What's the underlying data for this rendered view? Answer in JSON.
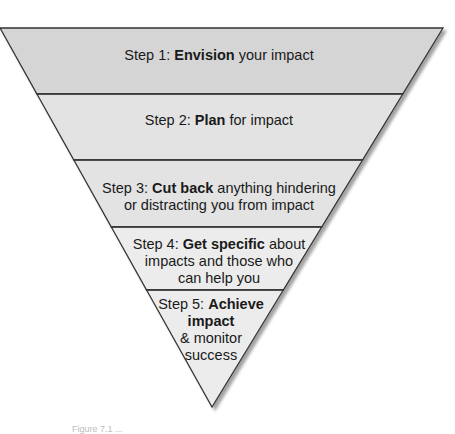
{
  "diagram": {
    "type": "inverted-funnel",
    "colors": {
      "band_top": "#d5d5d5",
      "band_mid": "#e3e3e3",
      "band_low": "#ececec",
      "outline": "#333333",
      "shadow": "#9a9a9a"
    },
    "steps": [
      {
        "prefix": "Step 1: ",
        "bold": "Envision",
        "suffix": " your impact",
        "lines": [
          [
            "Step 1: ",
            "Envision",
            " your impact"
          ]
        ]
      },
      {
        "prefix": "Step 2: ",
        "bold": "Plan",
        "suffix": " for impact",
        "lines": [
          [
            "Step 2: ",
            "Plan",
            " for impact"
          ]
        ]
      },
      {
        "prefix": "Step 3: ",
        "bold": "Cut back",
        "suffix": " anything hindering or distracting you from impact",
        "lines": [
          [
            "Step 3: ",
            "Cut back",
            " anything hindering"
          ],
          [
            "",
            "",
            "or distracting you from impact"
          ]
        ]
      },
      {
        "prefix": "Step 4: ",
        "bold": "Get specific",
        "suffix": " about impacts and those who can help you",
        "lines": [
          [
            "Step 4: ",
            "Get specific",
            " about"
          ],
          [
            "",
            "",
            "impacts and those who"
          ],
          [
            "",
            "",
            "can help you"
          ]
        ]
      },
      {
        "prefix": "Step 5: ",
        "bold": "Achieve impact",
        "suffix": " & monitor success",
        "lines": [
          [
            "Step 5: ",
            "Achieve",
            ""
          ],
          [
            "",
            "impact",
            ""
          ],
          [
            "",
            "",
            "& monitor"
          ],
          [
            "",
            "",
            "success"
          ]
        ]
      }
    ],
    "caption": "Figure 7.1 ..."
  }
}
